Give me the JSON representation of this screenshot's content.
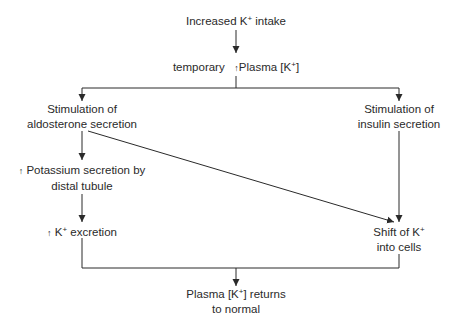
{
  "diagram": {
    "type": "flowchart",
    "nodes": {
      "intake": {
        "lines": [
          "Increased K",
          "+",
          " intake"
        ]
      },
      "plasma": {
        "prefix": "temporary",
        "arrow": "↑",
        "text": "Plasma [K",
        "sup": "+",
        "suffix": "]"
      },
      "aldosterone": {
        "line1": "Stimulation of",
        "line2": "aldosterone secretion"
      },
      "insulin": {
        "line1": "Stimulation of",
        "line2": "insulin secretion"
      },
      "potassium": {
        "arrow": "↑",
        "line1": "Potassium secretion by",
        "line2": "distal tubule"
      },
      "excretion": {
        "arrow": "↑",
        "text": "K",
        "sup": "+",
        "suffix": " excretion"
      },
      "shift": {
        "line1a": "Shift of K",
        "sup": "+",
        "line2": "into cells"
      },
      "normal": {
        "line1a": "Plasma [K",
        "sup": "+",
        "line1b": "] returns",
        "line2": "to normal"
      }
    },
    "edges": [
      [
        "Increased K+ intake",
        "temporary ↑Plasma [K+]"
      ],
      [
        "temporary ↑Plasma [K+]",
        "Stimulation of aldosterone secretion"
      ],
      [
        "temporary ↑Plasma [K+]",
        "Stimulation of insulin secretion"
      ],
      [
        "Stimulation of aldosterone secretion",
        "↑Potassium secretion by distal tubule"
      ],
      [
        "Stimulation of aldosterone secretion",
        "Shift of K+ into cells"
      ],
      [
        "↑Potassium secretion by distal tubule",
        "↑K+ excretion"
      ],
      [
        "Stimulation of insulin secretion",
        "Shift of K+ into cells"
      ],
      [
        "↑K+ excretion",
        "Plasma [K+] returns to normal"
      ],
      [
        "Shift of K+ into cells",
        "Plasma [K+] returns to normal"
      ]
    ],
    "colors": {
      "line": "#2a2a2a",
      "text": "#2a2a2a",
      "background": "#ffffff"
    }
  }
}
